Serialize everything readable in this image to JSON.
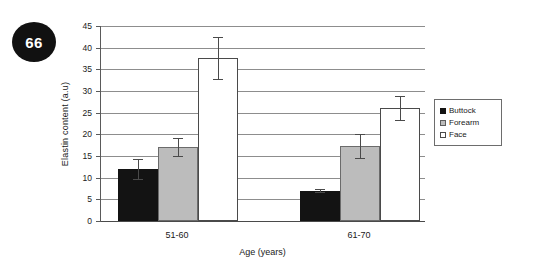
{
  "badge": {
    "label": "66"
  },
  "chart_data": {
    "type": "bar",
    "title": "",
    "xlabel": "Age (years)",
    "ylabel": "Elastin content (a.u)",
    "categories": [
      "51-60",
      "61-70"
    ],
    "ylim": [
      0,
      45
    ],
    "yticks": [
      0,
      5,
      10,
      15,
      20,
      25,
      30,
      35,
      40,
      45
    ],
    "ytick_labels": [
      "0",
      "5",
      "10",
      "15",
      "20",
      "25",
      "30",
      "35",
      "40",
      "45"
    ],
    "grid": true,
    "legend_position": "right",
    "series": [
      {
        "name": "Buttock",
        "color": "#131313",
        "values": [
          12.0,
          7.0
        ],
        "errors": [
          2.2,
          0.4
        ]
      },
      {
        "name": "Forearm",
        "color": "#bcbcbc",
        "values": [
          17.1,
          17.3
        ],
        "errors": [
          2.1,
          2.8
        ]
      },
      {
        "name": "Face",
        "color": "#ffffff",
        "values": [
          37.6,
          26.1
        ],
        "errors": [
          4.9,
          2.8
        ]
      }
    ]
  }
}
